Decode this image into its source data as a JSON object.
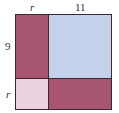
{
  "diagram": {
    "labels": {
      "top_left": "r",
      "top_right": "11",
      "left_top": "9",
      "left_bottom": "r"
    },
    "regions": [
      {
        "name": "r-by-9",
        "color": "#a8566f"
      },
      {
        "name": "11-by-9",
        "color": "#c3d1ea"
      },
      {
        "name": "r-by-r",
        "color": "#ecd2df"
      },
      {
        "name": "11-by-r",
        "color": "#a8566f"
      }
    ]
  }
}
